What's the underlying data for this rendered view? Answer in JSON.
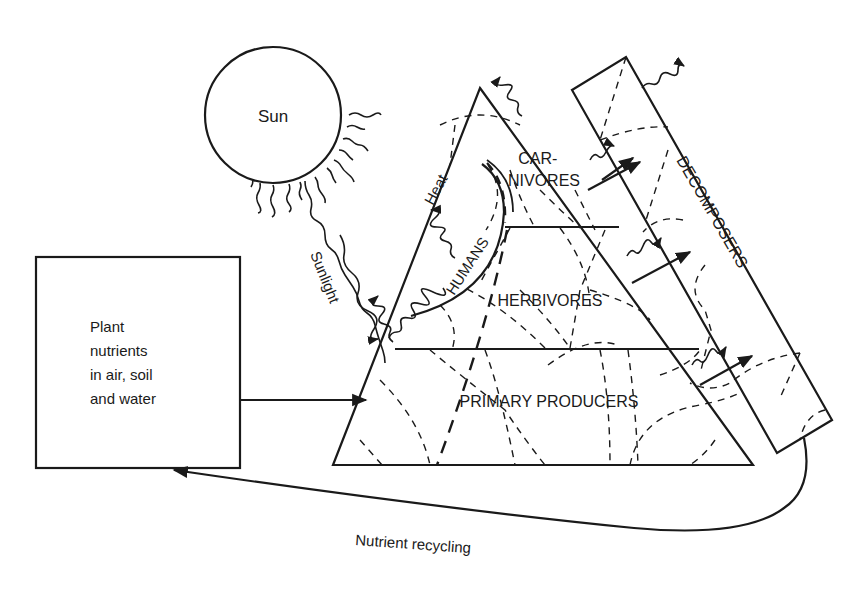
{
  "diagram": {
    "sun": {
      "label": "Sun"
    },
    "sunlight": {
      "label": "Sunlight"
    },
    "heat": {
      "label": "Heat"
    },
    "nutrient_box": {
      "lines": [
        "Plant",
        "nutrients",
        "in air, soil",
        "and water"
      ]
    },
    "pyramid": {
      "levels": [
        {
          "id": "carnivores",
          "lines": [
            "CAR-",
            "NIVORES"
          ]
        },
        {
          "id": "herbivores",
          "label": "HERBIVORES"
        },
        {
          "id": "primary_producers",
          "label": "PRIMARY PRODUCERS"
        }
      ],
      "humans": {
        "label": "HUMANS"
      }
    },
    "decomposers": {
      "label": "DECOMPOSERS"
    },
    "recycling": {
      "label": "Nutrient recycling"
    },
    "colors": {
      "line": "#1a1a1a",
      "background": "#ffffff"
    }
  }
}
